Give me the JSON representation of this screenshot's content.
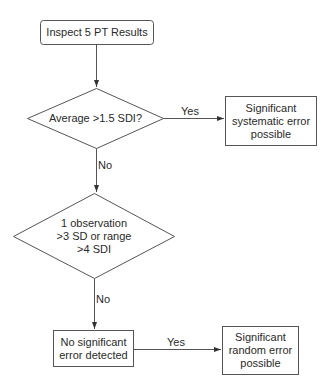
{
  "diagram": {
    "type": "flowchart",
    "colors": {
      "stroke": "#555555",
      "text": "#2a2a2a",
      "background": "#ffffff"
    },
    "nodes": {
      "start": {
        "shape": "rounded-rect",
        "label": "Inspect 5 PT Results"
      },
      "decision1": {
        "shape": "diamond",
        "label": "Average >1.5 SDI?"
      },
      "systematic": {
        "shape": "rect",
        "lines": [
          "Significant",
          "systematic error",
          "possible"
        ]
      },
      "decision2": {
        "shape": "diamond",
        "lines": [
          "1 observation",
          ">3 SD or range",
          ">4 SDI"
        ]
      },
      "no_error": {
        "shape": "rect",
        "lines": [
          "No significant",
          "error detected"
        ]
      },
      "random": {
        "shape": "rect",
        "lines": [
          "Significant",
          "random error",
          "possible"
        ]
      }
    },
    "edges": {
      "start_to_d1": {
        "label": ""
      },
      "d1_yes": {
        "label": "Yes"
      },
      "d1_no": {
        "label": "No"
      },
      "d2_no": {
        "label": "No"
      },
      "noerr_yes": {
        "label": "Yes"
      }
    }
  }
}
